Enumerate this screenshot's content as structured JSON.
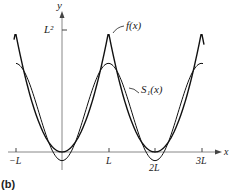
{
  "panel_label": "(b)",
  "chart_data": {
    "type": "line",
    "title": "",
    "xlabel": "x",
    "ylabel": "y",
    "x_ticks": [
      "-L",
      "L",
      "2L",
      "3L"
    ],
    "y_ticks": [
      "L²"
    ],
    "x_range": [
      "-L",
      "3L"
    ],
    "y_range": [
      0,
      "L²"
    ],
    "series": [
      {
        "name": "f(x)",
        "description": "periodic extension of x², period 2L; minima 0 at x=0, 2L; peaks L² at x=±L, 3L",
        "points": [
          [
            "-L",
            "L²"
          ],
          [
            0,
            0
          ],
          [
            "L",
            "L²"
          ],
          [
            "2L",
            0
          ],
          [
            "3L",
            "L²"
          ]
        ]
      },
      {
        "name": "S₁(x)",
        "description": "first partial Fourier sum: L²/3 − (4L²/π²)cos(πx/L)",
        "points": [
          [
            "-L",
            "0.739L²"
          ],
          [
            0,
            "-0.072L²"
          ],
          [
            "L",
            "0.739L²"
          ],
          [
            "2L",
            "-0.072L²"
          ],
          [
            "3L",
            "0.739L²"
          ]
        ]
      }
    ],
    "annotations": [
      "f(x)",
      "S₁(x)"
    ],
    "grid": false,
    "legend": "none (inline labels)"
  },
  "labels": {
    "y_axis": "y",
    "x_axis": "x",
    "y_tick": "L²",
    "x_tick_neg_L": "−L",
    "x_tick_L": "L",
    "x_tick_2L": "2L",
    "x_tick_3L": "3L",
    "f_label": "f(x)",
    "s1_label": "S₁(x)"
  }
}
